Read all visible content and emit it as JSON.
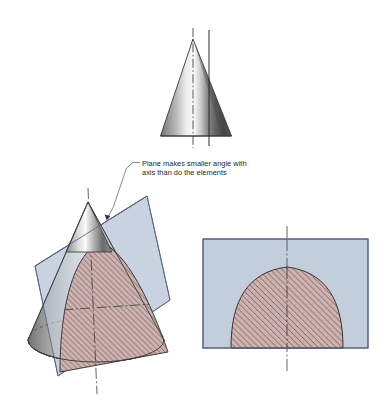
{
  "figure": {
    "background_color": "#ffffff"
  },
  "annotation": {
    "line1": "Plane makes smaller angle with",
    "line2": "axis than do the elements",
    "text_color": "#231f20",
    "leader_color": "#5a6475"
  },
  "views": {
    "top_cone": {
      "name": "Front view of cone with edge view of cutting plane",
      "axis_style": "dash-dot centerline",
      "cutting_plane_style": "solid vertical line",
      "cone_outline_color": "#3c3c3c",
      "axis_color": "#3a3a3a",
      "plane_line_color": "#2b2b2b"
    },
    "pictorial": {
      "name": "Pictorial view of cone cut by inclined plane",
      "plane_fill": "#c3cedd",
      "plane_edge_color": "#55617a",
      "section_fill": "#cdb2b0",
      "section_hatch_color": "#4a3b3b",
      "cone_outline_color": "#3c3c3c",
      "hidden_line_style": "dashed",
      "axis_color": "#4a4a4a"
    },
    "true_shape": {
      "name": "True shape of the parabolic section",
      "rect_fill": "#c3cedd",
      "rect_border_color": "#55617a",
      "section_fill": "#cdb2b0",
      "section_hatch_color": "#4a3b3b",
      "section_outline_color": "#3b3030",
      "axis_color": "#4a4a4a",
      "axis_style": "dash-dot centerline"
    }
  },
  "geometry": {
    "top_cone": {
      "apex": [
        193,
        39
      ],
      "base_left": [
        160,
        136
      ],
      "base_right": [
        232,
        136
      ],
      "axis_x": 193,
      "plane_line_x": 209,
      "axis_top_y": 28,
      "axis_bottom_y": 148,
      "plane_line_top_y": 30,
      "plane_line_bottom_y": 146
    },
    "pictorial_cone": {
      "apex": [
        88,
        202
      ],
      "base_center": [
        96,
        340
      ],
      "base_rx": 68,
      "base_ry": 22,
      "axis_x_top": 88,
      "axis_x_bottom": 96,
      "axis_top_y": 188,
      "axis_bottom_y": 392
    },
    "cut_plane_quad": [
      [
        35,
        266
      ],
      [
        147,
        196
      ],
      [
        170,
        300
      ],
      [
        58,
        376
      ]
    ],
    "true_shape_rect": {
      "x": 203,
      "y": 239,
      "width": 165,
      "height": 109
    },
    "true_shape_parabola": {
      "apex": [
        287,
        267
      ],
      "half_width": 56,
      "base_y": 348,
      "axis_x": 287,
      "axis_top_y": 226,
      "axis_bottom_y": 372
    }
  }
}
